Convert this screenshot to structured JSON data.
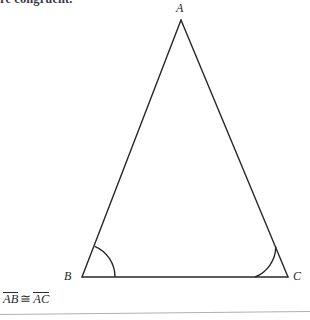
{
  "figure": {
    "kind": "geometry-diagram",
    "caption_fragment": "re congruent.",
    "stroke_color": "#26262c",
    "background_color": "#ffffff",
    "rule_color": "#b0b0b4",
    "vertices": [
      {
        "name": "A",
        "label": "A",
        "x": 181,
        "y": 20
      },
      {
        "name": "B",
        "label": "B",
        "x": 82,
        "y": 277
      },
      {
        "name": "C",
        "label": "C",
        "x": 288,
        "y": 277
      }
    ],
    "sides": [
      {
        "name": "AB",
        "from": "A",
        "to": "B"
      },
      {
        "name": "AC",
        "from": "A",
        "to": "C"
      },
      {
        "name": "BC",
        "from": "B",
        "to": "C"
      }
    ],
    "angle_marks": [
      {
        "at": "B",
        "radius": 33,
        "arcs": 1
      },
      {
        "at": "C",
        "radius": 33,
        "arcs": 1
      }
    ],
    "statement": {
      "left_segment": "AB",
      "relation": "≅",
      "right_segment": "AC",
      "full_text": "AB ≅ AC"
    }
  }
}
